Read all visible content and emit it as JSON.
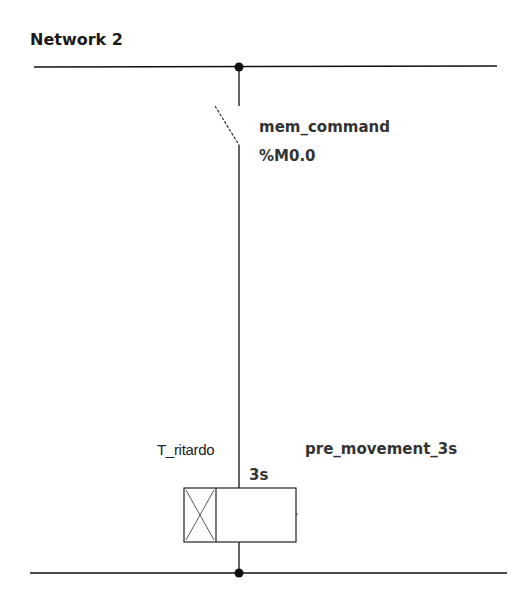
{
  "network": {
    "title": "Network 2"
  },
  "contact": {
    "type": "normally-open-contact",
    "symbol": "mem_command",
    "address": "%M0.0"
  },
  "timer_coil": {
    "type": "on-delay-timer-coil",
    "instance": "T_ritardo",
    "preset": "3s",
    "symbol": "pre_movement_3s"
  },
  "colors": {
    "line": "#111111",
    "text": "#333333",
    "background": "#ffffff"
  }
}
